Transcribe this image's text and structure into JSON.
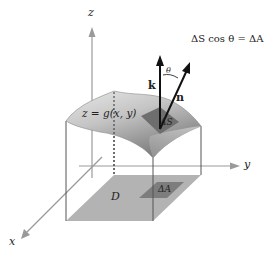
{
  "figure": {
    "equation": "ΔS cos θ = ΔA",
    "surface_label": "z = g(x, y)",
    "patch_surface_label": "ΔS",
    "patch_domain_label": "ΔA",
    "domain_label": "D",
    "vectors": {
      "k": "k",
      "n": "n",
      "angle": "θ"
    },
    "axes": {
      "x": "x",
      "y": "y",
      "z": "z"
    },
    "colors": {
      "axis": "#9a9a9a",
      "edge": "#555555",
      "domain_fill": "#b3b3b3",
      "patch_fill": "#777777",
      "surface_light": "#e4e4e4",
      "surface_dark": "#8a8a8a",
      "vector": "#111111"
    }
  }
}
